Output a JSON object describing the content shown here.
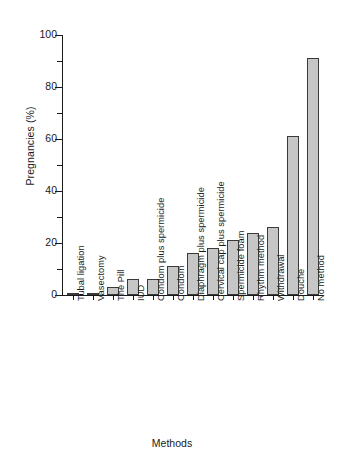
{
  "chart_data": {
    "type": "bar",
    "title": "",
    "xlabel": "Methods",
    "ylabel": "Pregnancies (%)",
    "ylim": [
      0,
      100
    ],
    "grid": false,
    "legend": null,
    "y_major_ticks": [
      0,
      20,
      40,
      60,
      80,
      100
    ],
    "y_minor_ticks": [
      10,
      30,
      50,
      70,
      90
    ],
    "y_tick_labels": [
      "0",
      "20",
      "40",
      "60",
      "80",
      "100"
    ],
    "bar_color": "#c6c6c6",
    "bar_edge_color": "#3a3a3a",
    "categories": [
      "Tubal ligation",
      "Vasectomy",
      "The Pill",
      "IUD",
      "Condom plus spermicide",
      "Condom",
      "Diaphragm plus spermicide",
      "Cervical cap plus spermicide",
      "Spermicide foam",
      "Rhythm method",
      "Withdrawal",
      "Douche",
      "No method"
    ],
    "values": [
      0.4,
      0.4,
      3,
      6,
      6,
      11,
      16,
      18,
      21,
      24,
      26,
      61,
      91
    ]
  },
  "axes": {
    "ylabel": "Pregnancies (%)",
    "xlabel": "Methods"
  }
}
